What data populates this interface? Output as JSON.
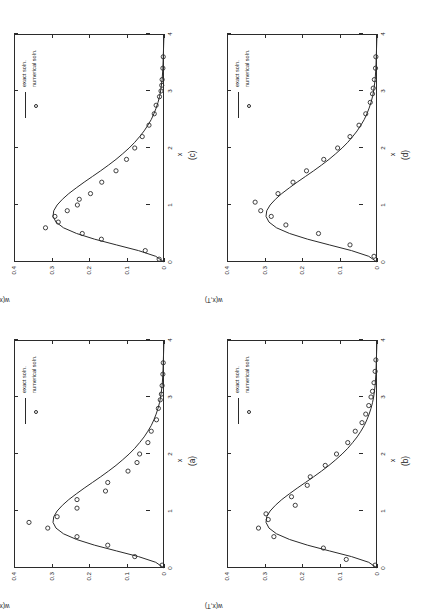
{
  "figure": {
    "background": "#ffffff",
    "ink": "#2b2b2b",
    "orientation": "page rotated 90 degrees (landscape plots on portrait sheet)",
    "panel_order": [
      "(c)",
      "(d)",
      "(a)",
      "(b)"
    ]
  },
  "legend": {
    "exact_label": "exact soln.",
    "numerical_label": "numerical soln."
  },
  "axes": {
    "xlabel": "x",
    "ylabel": "w(x,T)",
    "xticks": [
      "0",
      "1",
      "2",
      "3",
      "4"
    ],
    "xtickvals": [
      0,
      1,
      2,
      3,
      4
    ],
    "yticks": [
      "0",
      "0.1",
      "0.2",
      "0.3",
      "0.4"
    ],
    "ytickvals": [
      0,
      0.1,
      0.2,
      0.3,
      0.4
    ],
    "xlim": [
      0,
      4
    ],
    "ylim": [
      0,
      0.4
    ],
    "grid": "off"
  },
  "panels": [
    {
      "id": "c",
      "label": "(c)"
    },
    {
      "id": "d",
      "label": "(d)"
    },
    {
      "id": "a",
      "label": "(a)"
    },
    {
      "id": "b",
      "label": "(b)"
    }
  ],
  "chart_data": [
    {
      "type": "line",
      "panel": "(c)",
      "title": "",
      "xlabel": "x",
      "ylabel": "w(x,T)",
      "xlim": [
        0,
        4
      ],
      "ylim": [
        0,
        0.4
      ],
      "grid": false,
      "legend_position": "top-right",
      "series": [
        {
          "name": "exact soln.",
          "style": "solid line",
          "x": [
            0.0,
            0.1,
            0.2,
            0.3,
            0.4,
            0.5,
            0.6,
            0.7,
            0.8,
            0.9,
            1.0,
            1.1,
            1.2,
            1.3,
            1.4,
            1.5,
            1.6,
            1.7,
            1.8,
            1.9,
            2.0,
            2.1,
            2.2,
            2.3,
            2.4,
            2.5,
            2.6,
            2.7,
            2.8,
            2.9,
            3.0,
            3.2,
            3.4,
            3.6,
            3.8,
            4.0
          ],
          "y": [
            0.0,
            0.022,
            0.068,
            0.127,
            0.185,
            0.233,
            0.268,
            0.288,
            0.296,
            0.294,
            0.285,
            0.271,
            0.254,
            0.234,
            0.213,
            0.191,
            0.169,
            0.148,
            0.128,
            0.11,
            0.093,
            0.078,
            0.065,
            0.053,
            0.043,
            0.034,
            0.027,
            0.021,
            0.016,
            0.012,
            0.009,
            0.005,
            0.003,
            0.002,
            0.001,
            0.0
          ]
        },
        {
          "name": "numerical soln.",
          "style": "open circle markers",
          "x": [
            0.05,
            0.2,
            0.4,
            0.5,
            0.6,
            0.7,
            0.8,
            0.9,
            1.0,
            1.1,
            1.2,
            1.4,
            1.6,
            1.8,
            2.0,
            2.2,
            2.4,
            2.6,
            2.75,
            2.9,
            3.0,
            3.1,
            3.2,
            3.4,
            3.6
          ],
          "y": [
            0.013,
            0.05,
            0.167,
            0.218,
            0.316,
            0.282,
            0.291,
            0.258,
            0.231,
            0.226,
            0.196,
            0.166,
            0.128,
            0.1,
            0.078,
            0.058,
            0.04,
            0.026,
            0.021,
            0.012,
            0.008,
            0.006,
            0.005,
            0.003,
            0.002
          ]
        }
      ]
    },
    {
      "type": "line",
      "panel": "(d)",
      "title": "",
      "xlabel": "x",
      "ylabel": "w(x,T)",
      "xlim": [
        0,
        4
      ],
      "ylim": [
        0,
        0.4
      ],
      "grid": false,
      "legend_position": "top-right",
      "series": [
        {
          "name": "exact soln.",
          "style": "solid line",
          "x": [
            0.0,
            0.1,
            0.2,
            0.3,
            0.4,
            0.5,
            0.6,
            0.7,
            0.8,
            0.9,
            1.0,
            1.1,
            1.2,
            1.3,
            1.4,
            1.5,
            1.6,
            1.7,
            1.8,
            1.9,
            2.0,
            2.1,
            2.2,
            2.3,
            2.4,
            2.5,
            2.6,
            2.7,
            2.8,
            2.9,
            3.0,
            3.2,
            3.4,
            3.6,
            3.8,
            4.0
          ],
          "y": [
            0.0,
            0.022,
            0.068,
            0.127,
            0.185,
            0.233,
            0.268,
            0.288,
            0.296,
            0.294,
            0.285,
            0.271,
            0.254,
            0.234,
            0.213,
            0.191,
            0.169,
            0.148,
            0.128,
            0.11,
            0.093,
            0.078,
            0.065,
            0.053,
            0.043,
            0.034,
            0.027,
            0.021,
            0.016,
            0.012,
            0.009,
            0.005,
            0.003,
            0.002,
            0.001,
            0.0
          ]
        },
        {
          "name": "numerical soln.",
          "style": "open circle markers",
          "x": [
            0.1,
            0.3,
            0.5,
            0.65,
            0.8,
            0.9,
            1.05,
            1.2,
            1.4,
            1.6,
            1.8,
            2.0,
            2.2,
            2.4,
            2.6,
            2.8,
            2.95,
            3.05,
            3.2,
            3.4,
            3.6
          ],
          "y": [
            0.008,
            0.072,
            0.156,
            0.243,
            0.282,
            0.31,
            0.325,
            0.264,
            0.224,
            0.188,
            0.142,
            0.105,
            0.072,
            0.048,
            0.03,
            0.018,
            0.012,
            0.01,
            0.007,
            0.004,
            0.003
          ]
        }
      ]
    },
    {
      "type": "line",
      "panel": "(a)",
      "title": "",
      "xlabel": "x",
      "ylabel": "w(x,T)",
      "xlim": [
        0,
        4
      ],
      "ylim": [
        0,
        0.4
      ],
      "grid": false,
      "legend_position": "top-right",
      "series": [
        {
          "name": "exact soln.",
          "style": "solid line",
          "x": [
            0.0,
            0.1,
            0.2,
            0.3,
            0.4,
            0.5,
            0.6,
            0.7,
            0.8,
            0.9,
            1.0,
            1.1,
            1.2,
            1.3,
            1.4,
            1.5,
            1.6,
            1.7,
            1.8,
            1.9,
            2.0,
            2.1,
            2.2,
            2.3,
            2.4,
            2.5,
            2.6,
            2.7,
            2.8,
            2.9,
            3.0,
            3.2,
            3.4,
            3.6,
            3.8,
            4.0
          ],
          "y": [
            0.0,
            0.022,
            0.068,
            0.127,
            0.185,
            0.233,
            0.268,
            0.288,
            0.296,
            0.294,
            0.285,
            0.271,
            0.254,
            0.234,
            0.213,
            0.191,
            0.169,
            0.148,
            0.128,
            0.11,
            0.093,
            0.078,
            0.065,
            0.053,
            0.043,
            0.034,
            0.027,
            0.021,
            0.016,
            0.012,
            0.009,
            0.005,
            0.003,
            0.002,
            0.001,
            0.0
          ]
        },
        {
          "name": "numerical soln.",
          "style": "open circle markers",
          "x": [
            0.05,
            0.2,
            0.4,
            0.55,
            0.7,
            0.8,
            0.9,
            1.05,
            1.2,
            1.35,
            1.5,
            1.7,
            1.85,
            2.0,
            2.2,
            2.4,
            2.6,
            2.8,
            2.95,
            3.05,
            3.2,
            3.4,
            3.6
          ],
          "y": [
            0.005,
            0.078,
            0.15,
            0.232,
            0.31,
            0.36,
            0.285,
            0.232,
            0.232,
            0.156,
            0.15,
            0.096,
            0.072,
            0.065,
            0.043,
            0.034,
            0.02,
            0.015,
            0.01,
            0.007,
            0.005,
            0.003,
            0.002
          ]
        }
      ]
    },
    {
      "type": "line",
      "panel": "(b)",
      "title": "",
      "xlabel": "x",
      "ylabel": "w(x,T)",
      "xlim": [
        0,
        4
      ],
      "ylim": [
        0,
        0.4
      ],
      "grid": false,
      "legend_position": "top-right",
      "series": [
        {
          "name": "exact soln.",
          "style": "solid line",
          "x": [
            0.0,
            0.1,
            0.2,
            0.3,
            0.4,
            0.5,
            0.6,
            0.7,
            0.8,
            0.9,
            1.0,
            1.1,
            1.2,
            1.3,
            1.4,
            1.5,
            1.6,
            1.7,
            1.8,
            1.9,
            2.0,
            2.1,
            2.2,
            2.3,
            2.4,
            2.5,
            2.6,
            2.7,
            2.8,
            2.9,
            3.0,
            3.2,
            3.4,
            3.6,
            3.8,
            4.0
          ],
          "y": [
            0.0,
            0.022,
            0.068,
            0.127,
            0.185,
            0.233,
            0.268,
            0.288,
            0.296,
            0.294,
            0.285,
            0.271,
            0.254,
            0.234,
            0.213,
            0.191,
            0.169,
            0.148,
            0.128,
            0.11,
            0.093,
            0.078,
            0.065,
            0.053,
            0.043,
            0.034,
            0.027,
            0.021,
            0.016,
            0.012,
            0.009,
            0.005,
            0.003,
            0.002,
            0.001,
            0.0
          ]
        },
        {
          "name": "numerical soln.",
          "style": "open circle markers",
          "x": [
            0.05,
            0.15,
            0.35,
            0.55,
            0.7,
            0.85,
            0.95,
            1.1,
            1.25,
            1.45,
            1.6,
            1.8,
            2.0,
            2.2,
            2.4,
            2.55,
            2.7,
            2.85,
            3.0,
            3.1,
            3.25,
            3.45,
            3.65
          ],
          "y": [
            0.005,
            0.082,
            0.143,
            0.275,
            0.316,
            0.29,
            0.296,
            0.218,
            0.228,
            0.186,
            0.178,
            0.138,
            0.108,
            0.078,
            0.058,
            0.04,
            0.03,
            0.022,
            0.016,
            0.012,
            0.008,
            0.005,
            0.003
          ]
        }
      ]
    }
  ]
}
